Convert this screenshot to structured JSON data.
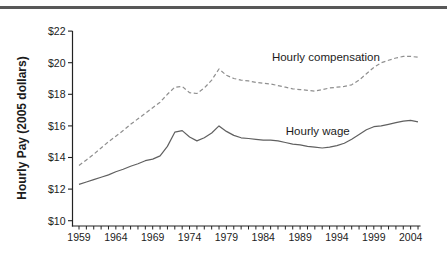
{
  "figure": {
    "background": "#ffffff",
    "top_rule_color": "#585858"
  },
  "chart_data": {
    "type": "line",
    "title": "",
    "xlabel": "",
    "ylabel": "Hourly Pay (2005 dollars)",
    "xlim": [
      1959,
      2005
    ],
    "ylim": [
      10,
      22
    ],
    "grid": false,
    "legend_position": "inline-annotations",
    "x_start_year": 1959,
    "x_end_year": 2005,
    "x_minor_tick_every": 1,
    "x_tick_labels": [
      "1959",
      "1964",
      "1969",
      "1974",
      "1979",
      "1984",
      "1989",
      "1994",
      "1999",
      "2004"
    ],
    "x_tick_label_years": [
      1959,
      1964,
      1969,
      1974,
      1979,
      1984,
      1989,
      1994,
      1999,
      2004
    ],
    "y_tick_labels": [
      "$10",
      "$12",
      "$14",
      "$16",
      "$18",
      "$20",
      "$22"
    ],
    "y_tick_values": [
      10,
      12,
      14,
      16,
      18,
      20,
      22
    ],
    "axis_color": "#222222",
    "series": [
      {
        "name": "Hourly compensation",
        "style": "dashed",
        "color": "#8f8f8f",
        "values": [
          13.5,
          13.85,
          14.2,
          14.6,
          15.0,
          15.35,
          15.7,
          16.1,
          16.45,
          16.8,
          17.15,
          17.5,
          18.0,
          18.45,
          18.5,
          18.1,
          18.05,
          18.4,
          18.9,
          19.6,
          19.2,
          19.0,
          18.9,
          18.85,
          18.75,
          18.7,
          18.65,
          18.55,
          18.45,
          18.35,
          18.3,
          18.25,
          18.2,
          18.3,
          18.4,
          18.45,
          18.5,
          18.6,
          18.9,
          19.3,
          19.7,
          20.0,
          20.15,
          20.3,
          20.4,
          20.4,
          20.35
        ]
      },
      {
        "name": "Hourly wage",
        "style": "solid",
        "color": "#606060",
        "values": [
          12.3,
          12.45,
          12.6,
          12.75,
          12.9,
          13.1,
          13.25,
          13.45,
          13.6,
          13.8,
          13.9,
          14.1,
          14.7,
          15.6,
          15.7,
          15.3,
          15.05,
          15.25,
          15.55,
          16.0,
          15.65,
          15.4,
          15.25,
          15.2,
          15.15,
          15.1,
          15.1,
          15.05,
          14.95,
          14.85,
          14.8,
          14.7,
          14.65,
          14.6,
          14.65,
          14.75,
          14.9,
          15.15,
          15.45,
          15.75,
          15.95,
          16.0,
          16.1,
          16.2,
          16.3,
          16.35,
          16.25
        ]
      }
    ],
    "annotations": [
      {
        "text": "Hourly compensation",
        "year": 1992.5,
        "value": 20.35,
        "series": "Hourly compensation"
      },
      {
        "text": "Hourly wage",
        "year": 1991.4,
        "value": 15.65,
        "series": "Hourly wage"
      }
    ]
  }
}
